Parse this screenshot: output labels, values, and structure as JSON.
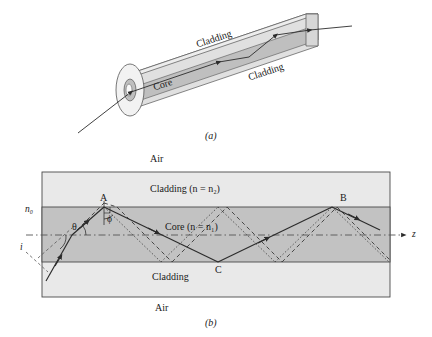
{
  "figure": {
    "panels": [
      {
        "id": "a",
        "caption": "(a)",
        "type": "3d-fiber-cylinder",
        "labels": {
          "cladding_top": "Cladding",
          "cladding_front": "Cladding",
          "core": "Core"
        }
      },
      {
        "id": "b",
        "caption": "(b)",
        "type": "cross-section-ray-diagram",
        "labels": {
          "air_top": "Air",
          "air_bottom": "Air",
          "cladding_top": "Cladding (n = n₂)",
          "cladding_bottom": "Cladding",
          "core": "Core (n = n₁)",
          "n_outside": "n₀",
          "angle_incidence": "i",
          "angle_theta": "θ",
          "angle_phi": "ϕ",
          "point_a": "A",
          "point_b": "B",
          "point_c": "C",
          "axis_z": "z"
        },
        "indices": {
          "outside": "n0",
          "core": "n1",
          "cladding": "n2"
        }
      }
    ],
    "colors": {
      "cladding_fill": "#e9e9e9",
      "core_fill": "#c2c2c2",
      "cylinder_top_fill": "#dedede",
      "cylinder_core_fill": "#bdbdbd",
      "stroke": "#333333",
      "ray": "#2b2b2b",
      "axis": "#555555"
    }
  }
}
